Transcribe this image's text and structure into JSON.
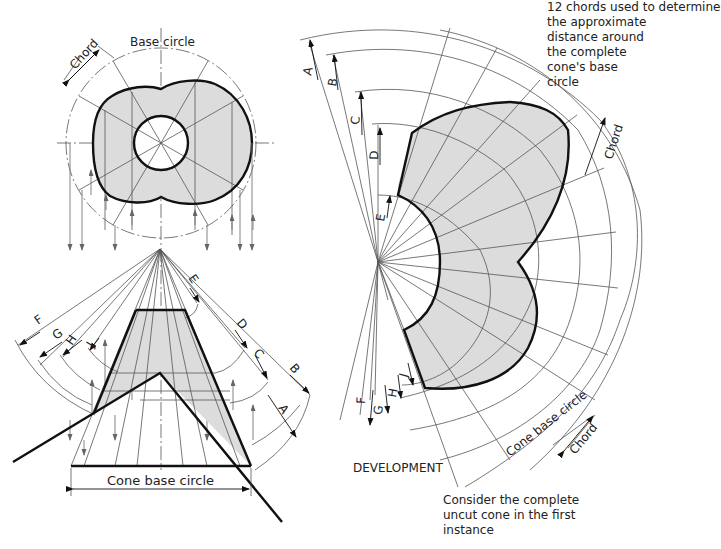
{
  "labels": {
    "base_circle": "Base circle",
    "chord_plan": "Chord",
    "cone_base_circle_elevation": "Cone base circle",
    "development": "DEVELOPMENT",
    "cone_base_circle_development": "Cone base circle",
    "chord_development_top": "Chord",
    "chord_development_bottom": "Chord",
    "note_chords": "12 chords used to determine\nthe approximate\ndistance around\nthe complete\ncone's base\ncircle",
    "note_uncut": "Consider the complete\nuncut cone in the first\ninstance"
  },
  "generator_letters": {
    "elevation_right": [
      "E",
      "D",
      "C",
      "B",
      "A"
    ],
    "elevation_left": [
      "F",
      "G",
      "H",
      "J"
    ],
    "development_top": [
      "A",
      "B",
      "C",
      "D",
      "E"
    ],
    "development_bottom": [
      "F",
      "G",
      "H",
      "J"
    ]
  },
  "colors": {
    "fill": "#dcdcdc",
    "outline": "#111111",
    "construction": "#555555"
  }
}
